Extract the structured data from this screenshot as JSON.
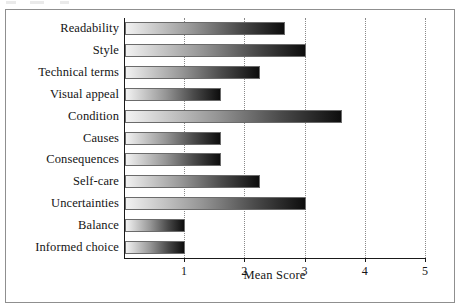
{
  "figure": {
    "background": "#ffffff",
    "frame_color": "#8f8f8f",
    "axis_color": "#1a1a1a",
    "gridline_color": "#8a8a8a",
    "bar_gradient_from": "#f2f2f2",
    "bar_gradient_to": "#0d0d0d"
  },
  "chart_data": {
    "type": "bar",
    "orientation": "horizontal",
    "title": "",
    "xlabel": "Mean Score",
    "ylabel": "",
    "xlim": [
      0,
      5
    ],
    "xticks": [
      "1",
      "2",
      "3",
      "4",
      "5"
    ],
    "grid": true,
    "legend": "none",
    "categories": [
      "Readability",
      "Style",
      "Technical terms",
      "Visual appeal",
      "Condition",
      "Causes",
      "Consequences",
      "Self-care",
      "Uncertainties",
      "Balance",
      "Informed choice"
    ],
    "values": [
      2.65,
      3.0,
      2.25,
      1.6,
      3.6,
      1.6,
      1.6,
      2.25,
      3.0,
      1.0,
      1.0
    ]
  }
}
